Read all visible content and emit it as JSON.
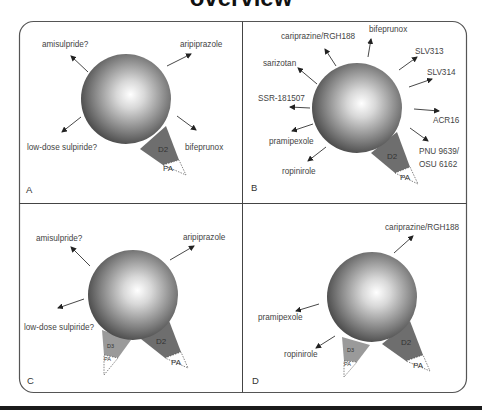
{
  "figure": {
    "title": "overview",
    "panels": [
      {
        "id": "A",
        "label": "A",
        "receptor_wedges": [
          {
            "name": "D2",
            "partial_agonism": "PA"
          }
        ],
        "drugs": [
          "amisulpride?",
          "aripiprazole",
          "low-dose sulpiride?",
          "bifeprunox"
        ]
      },
      {
        "id": "B",
        "label": "B",
        "receptor_wedges": [
          {
            "name": "D2",
            "partial_agonism": "PA"
          }
        ],
        "drugs": [
          "cariprazine/RGH188",
          "bifeprunox",
          "sarizotan",
          "SLV313",
          "SLV314",
          "SSR-181507",
          "ACR16",
          "pramipexole",
          "PNU 9639/",
          "OSU 6162",
          "ropinirole"
        ]
      },
      {
        "id": "C",
        "label": "C",
        "receptor_wedges": [
          {
            "name": "D3",
            "partial_agonism": "PA"
          },
          {
            "name": "D2",
            "partial_agonism": "PA"
          }
        ],
        "drugs": [
          "amisulpride?",
          "aripiprazole",
          "low-dose sulpiride?"
        ]
      },
      {
        "id": "D",
        "label": "D",
        "receptor_wedges": [
          {
            "name": "D3",
            "partial_agonism": "PA"
          },
          {
            "name": "D2",
            "partial_agonism": "PA"
          }
        ],
        "drugs": [
          "cariprazine/RGH188",
          "pramipexole",
          "ropinirole"
        ]
      }
    ],
    "colors": {
      "frame": "#555555",
      "d2_wedge": "#6e6e6e",
      "d3_wedge": "#9a9a9a",
      "sphere_light": "#ffffff",
      "sphere_dark": "#3a3a3a",
      "arrow": "#333333"
    }
  }
}
